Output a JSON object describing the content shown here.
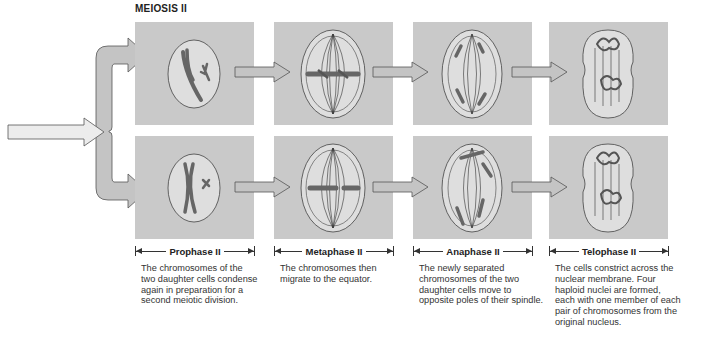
{
  "title": "MEIOSIS II",
  "colors": {
    "panel": "#c9c9c9",
    "cell": "#dedede",
    "chromosome": "#666666",
    "arrow_fill": "#c4c4c4",
    "arrow_stroke": "#555555"
  },
  "stages": [
    {
      "label": "Prophase II",
      "description_lines": [
        "The chromosomes of the",
        "two daughter cells condense",
        "again in preparation for a",
        "second meiotic division."
      ]
    },
    {
      "label": "Metaphase II",
      "description_lines": [
        "The chromosomes then",
        "migrate to the equator."
      ]
    },
    {
      "label": "Anaphase II",
      "description_lines": [
        "The newly separated",
        "chromosomes of the two",
        "daughter cells move to",
        "opposite poles of their spindle."
      ]
    },
    {
      "label": "Telophase II",
      "description_lines": [
        "The cells constrict across the",
        "nuclear membrane. Four",
        "haploid nuclei are formed,",
        "each with one member of each",
        "pair of chromosomes from the",
        "original nucleus."
      ]
    }
  ],
  "rows": [
    "top-daughter-cell",
    "bottom-daughter-cell"
  ]
}
